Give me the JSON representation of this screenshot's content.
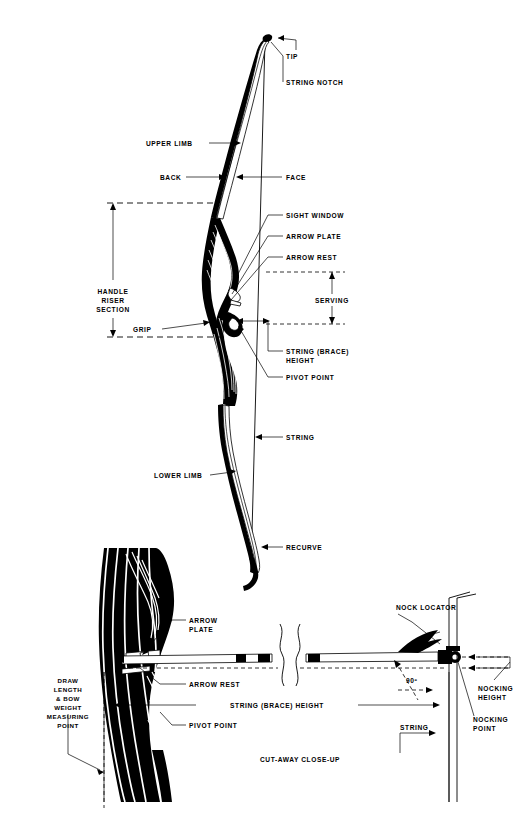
{
  "diagram": {
    "sections": {
      "upper": "Full bow side view",
      "lower": "Cut-away close-up"
    }
  },
  "labels": {
    "tip": "TIP",
    "string_notch": "STRING NOTCH",
    "upper_limb": "UPPER LIMB",
    "back": "BACK",
    "face": "FACE",
    "sight_window": "SIGHT WINDOW",
    "arrow_plate": "ARROW PLATE",
    "arrow_rest": "ARROW REST",
    "serving": "SERVING",
    "handle_riser_section_l1": "HANDLE",
    "handle_riser_section_l2": "RISER",
    "handle_riser_section_l3": "SECTION",
    "grip": "GRIP",
    "string_brace_height_l1": "STRING (BRACE)",
    "string_brace_height_l2": "HEIGHT",
    "pivot_point": "PIVOT POINT",
    "string": "STRING",
    "lower_limb": "LOWER LIMB",
    "recurve": "RECURVE"
  },
  "closeup": {
    "arrow_plate_l1": "ARROW",
    "arrow_plate_l2": "PLATE",
    "arrow_rest": "ARROW REST",
    "draw_measure_l1": "DRAW",
    "draw_measure_l2": "LENGTH",
    "draw_measure_l3": "& BOW",
    "draw_measure_l4": "WEIGHT",
    "draw_measure_l5": "MEASURING",
    "draw_measure_l6": "POINT",
    "string_brace_height": "STRING (BRACE) HEIGHT",
    "pivot_point": "PIVOT POINT",
    "nock_locator": "NOCK LOCATOR",
    "angle": "90º",
    "nocking_height_l1": "NOCKING",
    "nocking_height_l2": "HEIGHT",
    "nocking_point_l1": "NOCKING",
    "nocking_point_l2": "POINT",
    "string": "STRING",
    "caption": "CUT-AWAY CLOSE-UP"
  },
  "colors": {
    "ink": "#000000",
    "paper": "#ffffff"
  }
}
